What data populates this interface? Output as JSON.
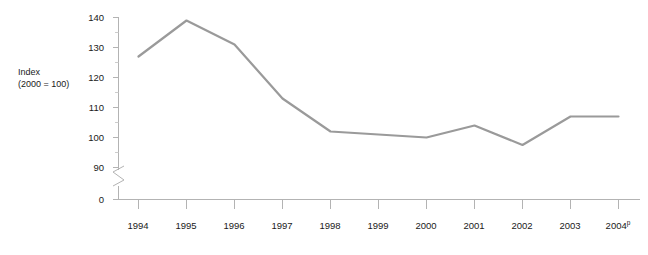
{
  "chart_data": {
    "type": "line",
    "title": "",
    "subtitle": "",
    "xlabel": "",
    "ylabel": "Index\n(2000 = 100)",
    "ylabel_line1": "Index",
    "ylabel_line2": "(2000 = 100)",
    "categories": [
      "1994",
      "1995",
      "1996",
      "1997",
      "1998",
      "1999",
      "2000",
      "2001",
      "2002",
      "2003",
      "2004"
    ],
    "tick_labels_x": [
      "1994",
      "1995",
      "1996",
      "1997",
      "1998",
      "1999",
      "2000",
      "2001",
      "2002",
      "2003",
      "2004"
    ],
    "x_tick_suffixes": [
      "",
      "",
      "",
      "",
      "",
      "",
      "",
      "",
      "",
      "",
      "p"
    ],
    "values": [
      127,
      139,
      131,
      113,
      102,
      101,
      100,
      104,
      97.5,
      107,
      107
    ],
    "series": [
      {
        "name": "Index (2000 = 100)",
        "values": [
          127,
          139,
          131,
          113,
          102,
          101,
          100,
          104,
          97.5,
          107,
          107
        ],
        "color": "#9a9a9a"
      }
    ],
    "y_tick_labels": [
      "140",
      "130",
      "120",
      "110",
      "100",
      "90",
      "0"
    ],
    "y_tick_values": [
      140,
      130,
      120,
      110,
      100,
      90,
      0
    ],
    "ylim": [
      90,
      140
    ],
    "axis_break": true,
    "axis_break_between": [
      0,
      90
    ],
    "grid": false,
    "legend": "none",
    "line_color": "#9a9a9a",
    "axis_color": "#b3b3b3",
    "footnote_marker": "p"
  },
  "figure": {
    "y_axis_name": "y-axis",
    "x_axis_name": "x-axis",
    "break_symbol": "axis-break"
  }
}
